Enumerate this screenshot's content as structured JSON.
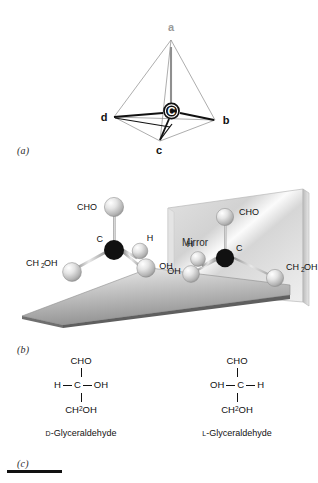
{
  "figure": {
    "background": "#ffffff",
    "panels": [
      {
        "key": "a",
        "label": "(a)"
      },
      {
        "key": "b",
        "label": "(b)"
      },
      {
        "key": "c",
        "label": "(c)"
      }
    ]
  },
  "panel_a": {
    "shape": "tetrahedron",
    "center_atom": "C",
    "vertices": [
      {
        "name": "a",
        "label": "a",
        "color": "#9a9a9a",
        "bold_bond": false
      },
      {
        "name": "b",
        "label": "b",
        "color": "#111111",
        "bold_bond": true
      },
      {
        "name": "c",
        "label": "c",
        "color": "#111111",
        "bold_bond": true
      },
      {
        "name": "d",
        "label": "d",
        "color": "#111111",
        "bold_bond": true
      }
    ]
  },
  "panel_b": {
    "mirror_label": "Mirror",
    "molecule_left": {
      "name": "d-glyceraldehyde-3d",
      "center_label": "C",
      "substituents": [
        {
          "name": "cho",
          "label": "CHO"
        },
        {
          "name": "ch2oh",
          "label": "CH",
          "sub": "2",
          "label_tail": "OH"
        },
        {
          "name": "h",
          "label": "H"
        },
        {
          "name": "oh",
          "label": "OH"
        }
      ]
    },
    "molecule_right": {
      "name": "l-glyceraldehyde-3d-mirror",
      "center_label": "C",
      "substituents": [
        {
          "name": "cho",
          "label": "CHO"
        },
        {
          "name": "h",
          "label": "H"
        },
        {
          "name": "oh",
          "label": "OH"
        },
        {
          "name": "ch2oh",
          "label": "CH",
          "sub": "2",
          "label_tail": "OH"
        }
      ]
    }
  },
  "panel_c": {
    "structures": [
      {
        "key": "d",
        "top": "CHO",
        "left": "H",
        "center": "C",
        "right": "OH",
        "bottom_main": "CH",
        "bottom_sub": "2",
        "bottom_tail": "OH",
        "prefix": "D",
        "name": "-Glyceraldehyde"
      },
      {
        "key": "l",
        "top": "CHO",
        "left": "OH",
        "center": "C",
        "right": "H",
        "bottom_main": "CH",
        "bottom_sub": "2",
        "bottom_tail": "OH",
        "prefix": "L",
        "name": "-Glyceraldehyde"
      }
    ]
  }
}
